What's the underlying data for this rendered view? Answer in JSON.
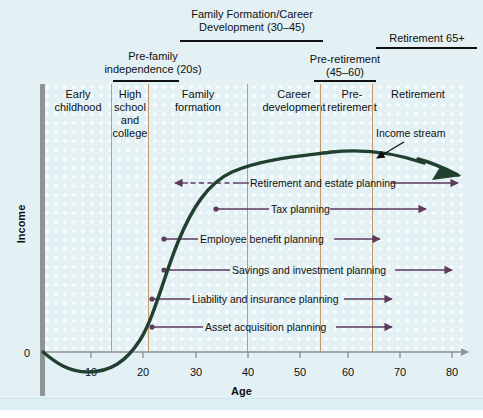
{
  "title_headers": [
    {
      "text": "Family Formation/Career\nDevelopment (30–45)",
      "left": 162,
      "top": 8,
      "width": 180,
      "rule_left": 180,
      "rule_top": 40,
      "rule_width": 143
    },
    {
      "text": "Pre-family\nindependence (20s)",
      "left": 78,
      "top": 50,
      "width": 150,
      "rule_left": 113,
      "rule_top": 80,
      "rule_width": 66
    },
    {
      "text": "Pre-retirement\n(45–60)",
      "left": 290,
      "top": 53,
      "width": 110,
      "rule_left": 314,
      "rule_top": 80,
      "rule_width": 62
    },
    {
      "text": "Retirement 65+",
      "left": 372,
      "top": 32,
      "width": 110,
      "rule_left": 376,
      "rule_top": 47,
      "rule_width": 101
    }
  ],
  "column_headers": [
    {
      "label": "Early\nchildhood",
      "left": 46,
      "top": 88,
      "width": 64
    },
    {
      "label": "High\nschool\nand\ncollege",
      "left": 112,
      "top": 88,
      "width": 36
    },
    {
      "label": "Family\nformation",
      "left": 150,
      "top": 88,
      "width": 96
    },
    {
      "label": "Career\ndevelopment",
      "left": 248,
      "top": 88,
      "width": 92
    },
    {
      "label": "Pre-\nretirement",
      "left": 322,
      "top": 88,
      "width": 60
    },
    {
      "label": "Retirement",
      "left": 374,
      "top": 88,
      "width": 88
    }
  ],
  "dividers": [
    111,
    148,
    247,
    320,
    372
  ],
  "axes": {
    "y_label": "Income",
    "y_zero": "0",
    "x_label": "Age",
    "x_ticks": [
      {
        "value": "10",
        "x": 91
      },
      {
        "value": "20",
        "x": 143
      },
      {
        "value": "30",
        "x": 196
      },
      {
        "value": "40",
        "x": 248
      },
      {
        "value": "50",
        "x": 300
      },
      {
        "value": "60",
        "x": 348
      },
      {
        "value": "70",
        "x": 400
      },
      {
        "value": "80",
        "x": 452
      }
    ]
  },
  "income_stream": {
    "label": "Income stream",
    "color": "#21402f"
  },
  "planning_lines": [
    {
      "label": "Retirement and estate planning",
      "label_left": 250,
      "label_top": 177,
      "y": 183,
      "dot_x": null,
      "left_arrow_x": 175,
      "dashed_from": 188,
      "dashed_to": 238,
      "solid_left_from": 238,
      "solid_left_to": 249,
      "solid_right_from": 391,
      "solid_right_to": 458,
      "right_arrow_x": 458
    },
    {
      "label": "Tax planning",
      "label_left": 271,
      "label_top": 203,
      "y": 209,
      "dot_x": 216,
      "left_arrow_x": null,
      "solid_left_from": 216,
      "solid_left_to": 269,
      "solid_right_from": 330,
      "solid_right_to": 426,
      "right_arrow_x": 426
    },
    {
      "label": "Employee benefit planning",
      "label_left": 200,
      "label_top": 233,
      "y": 239,
      "dot_x": 164,
      "solid_left_from": 164,
      "solid_left_to": 198,
      "solid_right_from": 334,
      "solid_right_to": 380,
      "right_arrow_x": 380
    },
    {
      "label": "Savings and investment planning",
      "label_left": 232,
      "label_top": 264,
      "y": 270,
      "dot_x": 164,
      "solid_left_from": 164,
      "solid_left_to": 230,
      "solid_right_from": 395,
      "solid_right_to": 452,
      "right_arrow_x": 452
    },
    {
      "label": "Liability and insurance planning",
      "label_left": 192,
      "label_top": 293,
      "y": 299,
      "dot_x": 152,
      "solid_left_from": 152,
      "solid_left_to": 190,
      "solid_right_from": 344,
      "solid_right_to": 392,
      "right_arrow_x": 392
    },
    {
      "label": "Asset acquisition planning",
      "label_left": 205,
      "label_top": 321,
      "y": 327,
      "dot_x": 152,
      "solid_left_from": 152,
      "solid_left_to": 203,
      "solid_right_from": 336,
      "solid_right_to": 392,
      "right_arrow_x": 392
    }
  ],
  "colors": {
    "background": "#e3f0f4",
    "divider": "#c09a6b",
    "axis": "#8d9396",
    "curve": "#21402f",
    "planning": "#5d3a5e"
  },
  "chart_data": {
    "type": "line",
    "xlabel": "Age",
    "ylabel": "Income",
    "xlim": [
      0,
      80
    ],
    "ylim": [
      0,
      100
    ],
    "grid": false,
    "legend": "none",
    "series": [
      {
        "name": "Income stream",
        "x": [
          0,
          5,
          10,
          15,
          20,
          22,
          25,
          28,
          30,
          35,
          40,
          45,
          50,
          55,
          60,
          65,
          70,
          75,
          80
        ],
        "y": [
          0,
          -10,
          -13,
          -8,
          2,
          8,
          22,
          42,
          54,
          74,
          84,
          89,
          92,
          94,
          94,
          92,
          88,
          82,
          76
        ]
      }
    ],
    "life_stages": [
      {
        "stage": "Early childhood",
        "age_range": "0–14"
      },
      {
        "stage": "High school and college",
        "age_range": "14–20"
      },
      {
        "stage": "Family formation",
        "age_range": "20–39"
      },
      {
        "stage": "Career development",
        "age_range": "39–53"
      },
      {
        "stage": "Pre-retirement",
        "age_range": "53–63"
      },
      {
        "stage": "Retirement",
        "age_range": "63–80"
      }
    ],
    "annotations": [
      "Family Formation/Career Development (30–45)",
      "Pre-family independence (20s)",
      "Pre-retirement (45–60)",
      "Retirement 65+",
      "Retirement and estate planning",
      "Tax planning",
      "Employee benefit planning",
      "Savings and investment planning",
      "Liability and insurance planning",
      "Asset acquisition planning"
    ]
  }
}
